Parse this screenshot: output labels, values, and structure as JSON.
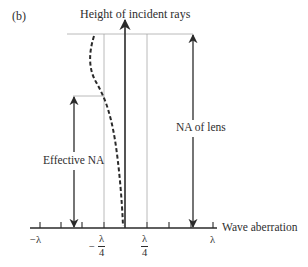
{
  "panel_label": "(b)",
  "axes": {
    "y_label": "Height of incident rays",
    "x_label": "Wave aberration"
  },
  "tick_labels": {
    "neg_lambda": "−λ",
    "neg_quarter": {
      "sign": "−",
      "num": "λ",
      "den": "4"
    },
    "pos_quarter": {
      "num": "λ",
      "den": "4"
    },
    "pos_lambda": "λ"
  },
  "annotations": {
    "effective_na": "Effective NA",
    "na_of_lens": "NA of lens"
  },
  "colors": {
    "ink": "#2a2a2a",
    "guide": "#9a9a9a"
  },
  "curve": {
    "style": "dashed",
    "description": "Wave aberration vs. ray height: near zero at axis, crosses −λ/4 at effective NA height, reaches about −1.3·λ/4 at the lens edge"
  }
}
